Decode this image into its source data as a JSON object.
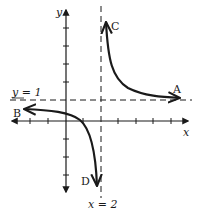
{
  "diagram": {
    "type": "rational-function-graph",
    "axes": {
      "x_label": "x",
      "y_label": "y"
    },
    "asymptotes": {
      "horizontal": {
        "label": "y = 1",
        "value": 1
      },
      "vertical": {
        "label": "x = 2",
        "value": 2
      }
    },
    "curve_labels": {
      "upper_right_top": "C",
      "upper_right_end": "A",
      "lower_left_end": "B",
      "lower_left_bottom": "D"
    },
    "x_ticks": [
      -2,
      -1,
      1,
      2,
      3,
      4,
      5,
      6
    ],
    "y_ticks": [
      -3,
      -2,
      -1,
      1,
      2,
      3,
      4
    ],
    "colors": {
      "ink": "#1a1a1a",
      "background": "#ffffff"
    }
  }
}
